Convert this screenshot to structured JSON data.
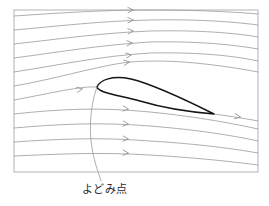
{
  "figure": {
    "title": "",
    "caption": "よどみ点",
    "caption_meaning": "stagnation point"
  },
  "colors": {
    "frame_border": "#b4b4b4",
    "streamline": "#9a9a9a",
    "arrow": "#8d8d8d",
    "airfoil_outline": "#141414",
    "leader": "#9a9a9a",
    "caption_text": "#2b2b2b",
    "background": "#ffffff"
  },
  "frame": {
    "x": 14,
    "y": 10,
    "width": 244,
    "height": 162
  },
  "chart_data": {
    "type": "line",
    "title": "",
    "xlabel": "",
    "ylabel": "",
    "xlim": [
      14,
      258
    ],
    "ylim": [
      10,
      172
    ],
    "grid": false,
    "legend": "none",
    "annotations": [
      {
        "text": "よどみ点",
        "x": 105,
        "y": 192,
        "points_to_x": 97,
        "points_to_y": 87
      }
    ],
    "airfoil": {
      "leading_edge": [
        97,
        87
      ],
      "trailing_edge": [
        214,
        114
      ],
      "upper_crest": [
        131,
        79
      ],
      "lower_point": [
        150,
        103
      ],
      "chord_length": 118
    },
    "series": [
      {
        "name": "streamline-1",
        "path": "M 14,16 C 60,13 100,10 150,10 C 200,10 235,12 258,14"
      },
      {
        "name": "streamline-2",
        "path": "M 14,30 C 60,26 100,21 150,20 C 200,19 235,22 258,25"
      },
      {
        "name": "streamline-3",
        "path": "M 14,44 C 60,39 100,33 150,31 C 200,30 235,33 258,37"
      },
      {
        "name": "streamline-4",
        "path": "M 14,58 C 60,52 100,45 150,42 C 200,41 235,45 258,49"
      },
      {
        "name": "streamline-5",
        "path": "M 14,72 C 60,65 100,56 150,53 C 200,52 235,56 258,61"
      },
      {
        "name": "streamline-6",
        "path": "M 14,86 C 55,79 90,68 122,63 C 160,58 210,63 258,72"
      },
      {
        "name": "streamline-7",
        "path": "M 14,100 C 52,93 80,86 97,87 C 120,89 160,104 214,114 C 235,117 248,119 258,121"
      },
      {
        "name": "streamline-8",
        "path": "M 14,114 C 60,109 100,107 150,112 C 200,117 235,124 258,129"
      },
      {
        "name": "streamline-9",
        "path": "M 14,128 C 60,124 100,122 150,126 C 200,130 235,136 258,141"
      },
      {
        "name": "streamline-10",
        "path": "M 14,142 C 60,139 100,137 150,141 C 200,144 235,149 258,153"
      },
      {
        "name": "streamline-11",
        "path": "M 14,156 C 60,154 100,152 150,155 C 200,158 235,162 258,165"
      }
    ],
    "arrows": [
      {
        "name": "arrow-1",
        "x": 133,
        "y": 10,
        "angle": -1
      },
      {
        "name": "arrow-2",
        "x": 133,
        "y": 20,
        "angle": -2
      },
      {
        "name": "arrow-3",
        "x": 133,
        "y": 31,
        "angle": -3
      },
      {
        "name": "arrow-4",
        "x": 132,
        "y": 43,
        "angle": -4
      },
      {
        "name": "arrow-5",
        "x": 131,
        "y": 55,
        "angle": -6
      },
      {
        "name": "arrow-6",
        "x": 129,
        "y": 62,
        "angle": -8
      },
      {
        "name": "arrow-7",
        "x": 82,
        "y": 89,
        "angle": -9
      },
      {
        "name": "arrow-8",
        "x": 128,
        "y": 109,
        "angle": 6
      },
      {
        "name": "arrow-9",
        "x": 128,
        "y": 124,
        "angle": 5
      },
      {
        "name": "arrow-10",
        "x": 128,
        "y": 139,
        "angle": 4
      },
      {
        "name": "arrow-11",
        "x": 128,
        "y": 153,
        "angle": 3
      },
      {
        "name": "arrow-trailing",
        "x": 240,
        "y": 117,
        "angle": 9
      }
    ],
    "leader_path": "M 97,87 C 92,100 88,125 92,148 C 95,165 99,174 101,181"
  }
}
